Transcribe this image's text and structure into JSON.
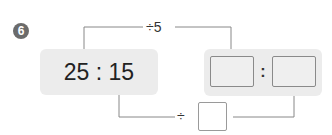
{
  "problem": {
    "number": "6",
    "given_ratio": {
      "first": "25",
      "separator": ":",
      "second": "15",
      "display": "25 : 15"
    },
    "top_operation": {
      "label": "÷5",
      "operator": "÷",
      "operand": "5"
    },
    "bottom_operation": {
      "operator": "÷",
      "operand": ""
    },
    "answer_ratio": {
      "first": "",
      "separator": ":",
      "second": ""
    }
  },
  "colors": {
    "badge": "#6b6b6b",
    "box_background": "#ececec",
    "line": "#777777",
    "text": "#222222"
  }
}
